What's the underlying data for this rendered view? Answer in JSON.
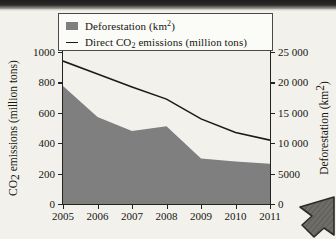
{
  "chart_data": {
    "type": "area",
    "title": "",
    "xlabel": "",
    "ylabel": "CO2 emissions (million tons)",
    "ylabel_right": "Deforestation (km2)",
    "categories": [
      2005,
      2006,
      2007,
      2008,
      2009,
      2010,
      2011
    ],
    "x": [
      "2005",
      "2006",
      "2007",
      "2008",
      "2009",
      "2010",
      "2011"
    ],
    "xlim": [
      2005,
      2011
    ],
    "ylim": [
      0,
      1000
    ],
    "ylim_right": [
      0,
      25000
    ],
    "yticks": [
      0,
      200,
      400,
      600,
      800,
      1000
    ],
    "yticks_right": [
      0,
      5000,
      10000,
      15000,
      20000,
      25000
    ],
    "ytick_labels": [
      "0",
      "200",
      "400",
      "600",
      "800",
      "1000"
    ],
    "ytick_labels_right": [
      "0",
      "5000",
      "10 000",
      "15 000",
      "20 000",
      "25 000"
    ],
    "grid": false,
    "legend_position": "top-center",
    "series": [
      {
        "name": "Deforestation (km2)",
        "type": "area",
        "axis": "right",
        "color": "#7f7f7f",
        "values": [
          19400,
          14300,
          12000,
          12800,
          7500,
          7000,
          6600
        ],
        "values_left_scale": [
          776,
          572,
          480,
          512,
          300,
          280,
          264
        ]
      },
      {
        "name": "Direct CO2 emissions (million tons)",
        "type": "line",
        "axis": "left",
        "color": "#1b1b1b",
        "values": [
          940,
          855,
          770,
          690,
          560,
          470,
          420
        ]
      }
    ]
  },
  "legend": {
    "items": [
      {
        "marker": "filled-square",
        "label_pre": "Deforestation (km",
        "label_sup": "2",
        "label_post": ")"
      },
      {
        "marker": "line",
        "label_pre": "Direct CO",
        "label_sub": "2",
        "label_post": " emissions (million tons)"
      }
    ]
  },
  "axis_titles": {
    "left_pre": "CO",
    "left_sub": "2",
    "left_post": " emissions (million tons)",
    "right_pre": "Deforestation (km",
    "right_sup": "2",
    "right_post": ")"
  },
  "colors": {
    "area_fill": "#7f7f7f",
    "line": "#1b1b1b",
    "axis": "#232323",
    "plot_background": "#fbfbf8",
    "page_background": "#f2f1ec"
  }
}
